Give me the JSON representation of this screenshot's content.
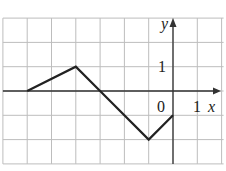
{
  "chart_data": {
    "type": "line",
    "title": "",
    "xlabel": "x",
    "ylabel": "y",
    "xlim": [
      -7,
      2
    ],
    "ylim": [
      -3,
      3
    ],
    "grid": true,
    "tick_labels": {
      "origin": "0",
      "x_unit": "1",
      "y_unit": "1"
    },
    "series": [
      {
        "name": "f",
        "x": [
          -6,
          -4,
          -3,
          -1,
          0
        ],
        "y": [
          0,
          1,
          0,
          -2,
          -1
        ]
      }
    ]
  },
  "colors": {
    "grid": "#bdbdbd",
    "axis": "#333333",
    "line": "#222222"
  }
}
